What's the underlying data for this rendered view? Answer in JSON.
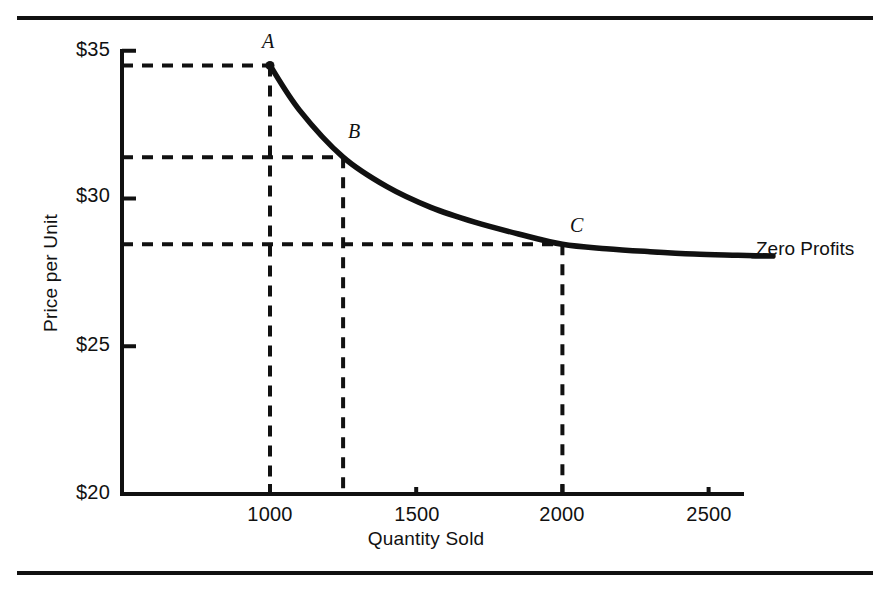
{
  "figure": {
    "background": "#ffffff",
    "ink_color": "#111111",
    "top_rule": true,
    "bottom_rule": true
  },
  "chart_data": {
    "type": "line",
    "title": "",
    "xlabel": "Quantity Sold",
    "ylabel": "Price per Unit",
    "xlim": [
      494,
      2800
    ],
    "ylim": [
      20,
      35
    ],
    "grid": false,
    "legend_position": "none",
    "xticks": [
      1000,
      1500,
      2000,
      2500
    ],
    "xtick_labels": [
      "1000",
      "1500",
      "2000",
      "2500"
    ],
    "yticks": [
      20,
      25,
      30,
      35
    ],
    "ytick_labels": [
      "$20",
      "$25",
      "$30",
      "$35"
    ],
    "series": [
      {
        "name": "Zero Profits",
        "style": "solid-thick",
        "x": [
          1000,
          1100,
          1250,
          1400,
          1550,
          1700,
          1850,
          2000,
          2150,
          2300,
          2450,
          2600,
          2720
        ],
        "y": [
          34.5,
          33.0,
          31.4,
          30.4,
          29.7,
          29.2,
          28.8,
          28.45,
          28.3,
          28.2,
          28.12,
          28.08,
          28.05
        ]
      }
    ],
    "annotations": [
      {
        "label": "Zero Profits",
        "x": 2720,
        "y": 28.05,
        "placement": "right"
      }
    ],
    "points": [
      {
        "label": "A",
        "x": 1000,
        "y": 34.5,
        "guides": [
          "horizontal",
          "vertical"
        ]
      },
      {
        "label": "B",
        "x": 1250,
        "y": 31.4,
        "guides": [
          "horizontal",
          "vertical"
        ]
      },
      {
        "label": "C",
        "x": 2000,
        "y": 28.45,
        "guides": [
          "horizontal",
          "vertical"
        ]
      }
    ]
  }
}
